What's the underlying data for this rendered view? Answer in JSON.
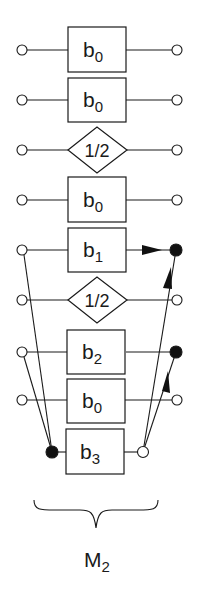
{
  "diagram": {
    "rows": [
      {
        "type": "box",
        "base": "b",
        "sub": "0",
        "y": 50
      },
      {
        "type": "box",
        "base": "b",
        "sub": "0",
        "y": 100
      },
      {
        "type": "diamond",
        "text": "1/2",
        "y": 150
      },
      {
        "type": "box",
        "base": "b",
        "sub": "0",
        "y": 200
      },
      {
        "type": "box",
        "base": "b",
        "sub": "1",
        "y": 250
      },
      {
        "type": "diamond",
        "text": "1/2",
        "y": 300
      },
      {
        "type": "box",
        "base": "b",
        "sub": "2",
        "y": 352
      },
      {
        "type": "box",
        "base": "b",
        "sub": "0",
        "y": 400
      },
      {
        "type": "box",
        "base": "b",
        "sub": "3",
        "y": 452
      }
    ],
    "brace_label": {
      "base": "M",
      "sub": "2"
    },
    "colors": {
      "stroke": "#1a1a1a",
      "fill_node": "#111111",
      "background": "#ffffff"
    }
  }
}
